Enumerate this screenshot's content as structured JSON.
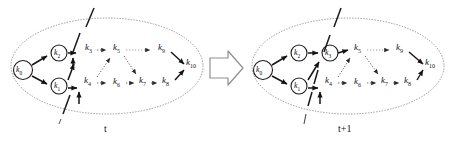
{
  "figure": {
    "type": "graph-evolution-diagram",
    "background_color": "#ffffff",
    "stroke_color": "#141414",
    "ellipse_style": "dotted",
    "cut_line_style": "dashed"
  },
  "transition_arrow": {
    "name": "block-arrow-right",
    "direction": "right"
  },
  "panels": [
    {
      "id": "panel-t",
      "time_label": "t",
      "cut_line": {
        "x_top": 94,
        "y_top": 8,
        "x_bottom": 62,
        "y_bottom": 120
      },
      "circled_nodes": [
        "k0",
        "k2",
        "k1"
      ],
      "nodes": [
        {
          "id": "k0",
          "label": "k",
          "sub": "0",
          "x": 22,
          "y": 68,
          "circled": true
        },
        {
          "id": "k2",
          "label": "k",
          "sub": "2",
          "x": 57,
          "y": 51,
          "circled": true
        },
        {
          "id": "k1",
          "label": "k",
          "sub": "1",
          "x": 57,
          "y": 84,
          "circled": true
        },
        {
          "id": "k3",
          "label": "k",
          "sub": "3",
          "x": 89,
          "y": 48,
          "circled": false
        },
        {
          "id": "k5",
          "label": "k",
          "sub": "5",
          "x": 117,
          "y": 48,
          "circled": false
        },
        {
          "id": "k9",
          "label": "k",
          "sub": "9",
          "x": 162,
          "y": 48,
          "circled": false
        },
        {
          "id": "k10",
          "label": "k",
          "sub": "10",
          "x": 189,
          "y": 63,
          "circled": false
        },
        {
          "id": "k4",
          "label": "k",
          "sub": "4",
          "x": 88,
          "y": 80,
          "circled": false
        },
        {
          "id": "k6",
          "label": "k",
          "sub": "6",
          "x": 117,
          "y": 81,
          "circled": false
        },
        {
          "id": "k7",
          "label": "k",
          "sub": "7",
          "x": 143,
          "y": 80,
          "circled": false
        },
        {
          "id": "k8",
          "label": "k",
          "sub": "8",
          "x": 166,
          "y": 80,
          "circled": false
        }
      ],
      "edges": [
        {
          "from": "k0",
          "to": "k2",
          "style": "solid"
        },
        {
          "from": "k0",
          "to": "k1",
          "style": "solid"
        },
        {
          "from": "k2",
          "to": "k3",
          "style": "solid"
        },
        {
          "from": "k1",
          "to": "k3",
          "style": "solid"
        },
        {
          "from": "k1",
          "to": "k4",
          "style": "solid"
        },
        {
          "from": "k3",
          "to": "k5",
          "style": "dotted"
        },
        {
          "from": "k4",
          "to": "k5",
          "style": "dotted"
        },
        {
          "from": "k4",
          "to": "k6",
          "style": "dotted"
        },
        {
          "from": "k5",
          "to": "k9",
          "style": "dotted"
        },
        {
          "from": "k5",
          "to": "k7",
          "style": "dotted"
        },
        {
          "from": "k6",
          "to": "k7",
          "style": "dotted"
        },
        {
          "from": "k7",
          "to": "k8",
          "style": "dotted"
        },
        {
          "from": "k9",
          "to": "k10",
          "style": "dotted"
        },
        {
          "from": "k8",
          "to": "k10",
          "style": "dotted"
        }
      ]
    },
    {
      "id": "panel-t1",
      "time_label": "t+1",
      "cut_line": {
        "x_top": 341,
        "y_top": 8,
        "x_bottom": 310,
        "y_bottom": 120
      },
      "circled_nodes": [
        "k0",
        "k2",
        "k1",
        "k3"
      ],
      "nodes": [
        {
          "id": "k0",
          "label": "k",
          "sub": "0",
          "x": 262,
          "y": 68,
          "circled": true
        },
        {
          "id": "k2",
          "label": "k",
          "sub": "2",
          "x": 297,
          "y": 51,
          "circled": true
        },
        {
          "id": "k1",
          "label": "k",
          "sub": "1",
          "x": 297,
          "y": 84,
          "circled": true
        },
        {
          "id": "k3",
          "label": "k",
          "sub": "3",
          "x": 328,
          "y": 51,
          "circled": true
        },
        {
          "id": "k5",
          "label": "k",
          "sub": "5",
          "x": 358,
          "y": 48,
          "circled": false
        },
        {
          "id": "k9",
          "label": "k",
          "sub": "9",
          "x": 400,
          "y": 48,
          "circled": false
        },
        {
          "id": "k10",
          "label": "k",
          "sub": "10",
          "x": 428,
          "y": 63,
          "circled": false
        },
        {
          "id": "k4",
          "label": "k",
          "sub": "4",
          "x": 329,
          "y": 80,
          "circled": false
        },
        {
          "id": "k6",
          "label": "k",
          "sub": "6",
          "x": 358,
          "y": 81,
          "circled": false
        },
        {
          "id": "k7",
          "label": "k",
          "sub": "7",
          "x": 385,
          "y": 80,
          "circled": false
        },
        {
          "id": "k8",
          "label": "k",
          "sub": "8",
          "x": 408,
          "y": 80,
          "circled": false
        }
      ],
      "edges": [
        {
          "from": "k0",
          "to": "k2",
          "style": "solid"
        },
        {
          "from": "k0",
          "to": "k1",
          "style": "solid"
        },
        {
          "from": "k2",
          "to": "k3",
          "style": "solid"
        },
        {
          "from": "k1",
          "to": "k3",
          "style": "solid"
        },
        {
          "from": "k1",
          "to": "k4",
          "style": "solid"
        },
        {
          "from": "k3",
          "to": "k5",
          "style": "solid"
        },
        {
          "from": "k4",
          "to": "k5",
          "style": "dotted"
        },
        {
          "from": "k4",
          "to": "k6",
          "style": "dotted"
        },
        {
          "from": "k5",
          "to": "k9",
          "style": "dotted"
        },
        {
          "from": "k5",
          "to": "k7",
          "style": "dotted"
        },
        {
          "from": "k6",
          "to": "k7",
          "style": "dotted"
        },
        {
          "from": "k7",
          "to": "k8",
          "style": "dotted"
        },
        {
          "from": "k9",
          "to": "k10",
          "style": "dotted"
        },
        {
          "from": "k8",
          "to": "k10",
          "style": "dotted"
        }
      ]
    }
  ]
}
